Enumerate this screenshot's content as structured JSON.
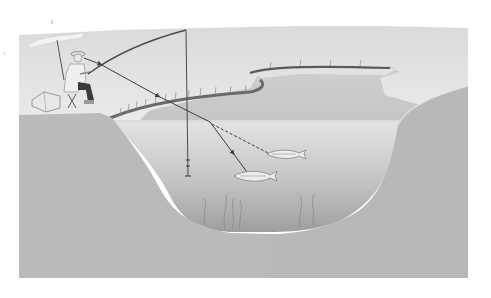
{
  "figure": {
    "colors": {
      "background": "#ffffff",
      "sky": "#e6e6e6",
      "far_water": "#d2d2d2",
      "near_water": "#c8c8c8",
      "deep_water_top": "#dcdcdc",
      "deep_water_bottom": "#a8a8a8",
      "bank": "#bababa",
      "line": "#4a4a4a",
      "reeds": "#6a6a6a"
    },
    "elements": [
      "umbrella",
      "angler",
      "folding-stool",
      "tackle-box",
      "fishing-rod",
      "fishing-line-with-arrows",
      "float-and-weight",
      "fish-on-hook",
      "fish-dashed-line",
      "reed-banks",
      "far-shore"
    ]
  }
}
